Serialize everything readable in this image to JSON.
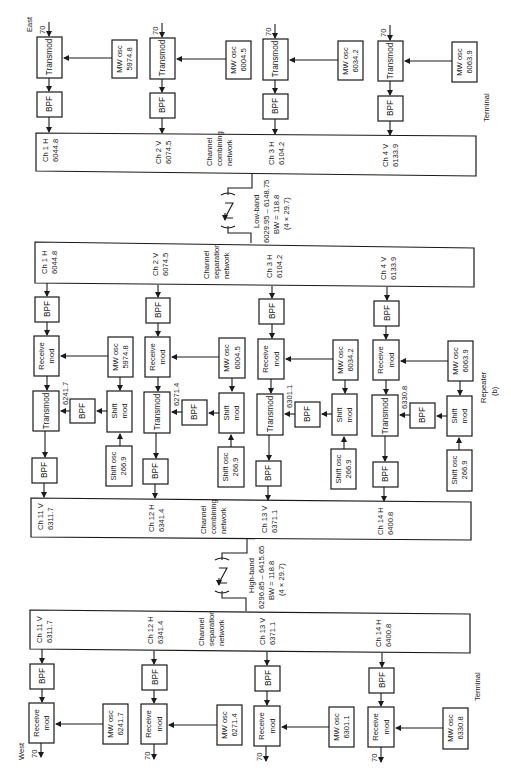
{
  "labels": {
    "east": "East",
    "west": "West",
    "terminal_top": "Terminal",
    "terminal_bottom": "Terminal",
    "repeater": "Repeater",
    "figure_tag": "(b)",
    "if_in": "70",
    "if_out": "70"
  },
  "blocks": {
    "transmod": "Transmod",
    "bpf": "BPF",
    "receive": "Receive",
    "mod": "mod",
    "shift": "Shift",
    "mw_osc": "MW osc",
    "shift_osc": "Shift osc"
  },
  "networks": {
    "combining": [
      "Channel",
      "combining",
      "network"
    ],
    "separation": [
      "Channel",
      "separation",
      "network"
    ]
  },
  "low_band": {
    "title": "Low-band",
    "range": "6029.95 – 6148.75",
    "bw": "BW = 118.8",
    "calc": "(4 × 29.7)"
  },
  "high_band": {
    "title": "High-band",
    "range": "6296.85 – 6415.65",
    "bw": "BW = 118.8",
    "calc": "(4 × 29.7)"
  },
  "low_channels": [
    {
      "name": "Ch 1 H",
      "freq": "6044.8",
      "mw_osc": "5974.8"
    },
    {
      "name": "Ch 2 V",
      "freq": "6074.5",
      "mw_osc": "6004.5"
    },
    {
      "name": "Ch 3 H",
      "freq": "6104.2",
      "mw_osc": "6034.2"
    },
    {
      "name": "Ch 4 V",
      "freq": "6133.9",
      "mw_osc": "6063.9"
    }
  ],
  "repeater_shift": [
    {
      "shift_out": "6241.7",
      "shift_osc": "266.9"
    },
    {
      "shift_out": "6271.4",
      "shift_osc": "266.9"
    },
    {
      "shift_out": "6301.1",
      "shift_osc": "266.9"
    },
    {
      "shift_out": "6330.8",
      "shift_osc": "266.9"
    }
  ],
  "high_channels": [
    {
      "name": "Ch 11 V",
      "freq": "6311.7",
      "mw_osc": "6241.7"
    },
    {
      "name": "Ch 12 H",
      "freq": "6341.4",
      "mw_osc": "6271.4"
    },
    {
      "name": "Ch 13 V",
      "freq": "6371.1",
      "mw_osc": "6301.1"
    },
    {
      "name": "Ch 14 H",
      "freq": "6400.8",
      "mw_osc": "6330.8"
    }
  ]
}
